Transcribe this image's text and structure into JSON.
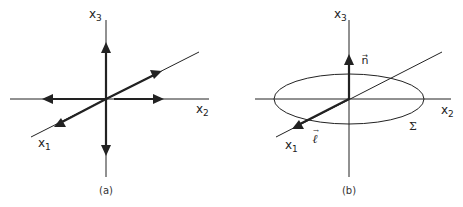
{
  "figure": {
    "colors": {
      "line": "#222222",
      "background": "#ffffff"
    },
    "panels": [
      {
        "id": "a",
        "caption": "(a)",
        "axes": {
          "x1": {
            "base": "x",
            "sub": "1"
          },
          "x2": {
            "base": "x",
            "sub": "2"
          },
          "x3": {
            "base": "x",
            "sub": "3"
          }
        },
        "arrows": [
          "+x3",
          "-x3",
          "+x2",
          "-x2",
          "+x1 (toward back)",
          "-x1 (toward front)"
        ]
      },
      {
        "id": "b",
        "caption": "(b)",
        "axes": {
          "x1": {
            "base": "x",
            "sub": "1"
          },
          "x2": {
            "base": "x",
            "sub": "2"
          },
          "x3": {
            "base": "x",
            "sub": "3"
          }
        },
        "vectors": {
          "n": {
            "label": "n",
            "accent": "→",
            "direction": "+x3"
          },
          "l": {
            "label": "ℓ",
            "accent": "→",
            "direction": "along x1 (front)"
          }
        },
        "surface": {
          "label": "Σ",
          "shape": "ellipse in x1-x2 plane"
        }
      }
    ]
  }
}
